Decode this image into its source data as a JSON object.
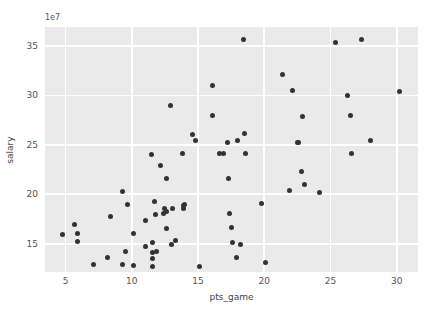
{
  "chart_data": {
    "type": "scatter",
    "title": "",
    "xlabel": "pts_game",
    "ylabel": "salary",
    "y_offset_text": "1e7",
    "y_offset_multiplier": 10000000,
    "xlim": [
      3.45,
      31.6
    ],
    "ylim": [
      12150000,
      36900000
    ],
    "xticks": [
      5,
      10,
      15,
      20,
      25,
      30
    ],
    "xtick_labels": [
      "5",
      "10",
      "15",
      "20",
      "25",
      "30"
    ],
    "yticks": [
      15000000,
      20000000,
      25000000,
      30000000,
      35000000
    ],
    "ytick_labels": [
      "15",
      "20",
      "25",
      "30",
      "35"
    ],
    "grid": true,
    "grid_color": "#ffffff",
    "axes_facecolor": "#eaeaea",
    "figure_facecolor": "#ffffff",
    "marker_color": "#333333",
    "marker_size": 5,
    "legend": null,
    "points": [
      [
        4.8,
        15900000
      ],
      [
        5.7,
        16900000
      ],
      [
        5.9,
        16000000
      ],
      [
        5.9,
        15200000
      ],
      [
        7.1,
        12900000
      ],
      [
        8.2,
        13600000
      ],
      [
        8.4,
        17800000
      ],
      [
        9.3,
        20300000
      ],
      [
        9.3,
        12900000
      ],
      [
        9.5,
        14200000
      ],
      [
        9.7,
        19000000
      ],
      [
        10.1,
        16000000
      ],
      [
        10.1,
        12800000
      ],
      [
        11.0,
        17400000
      ],
      [
        11.0,
        14700000
      ],
      [
        11.5,
        24000000
      ],
      [
        11.6,
        15100000
      ],
      [
        11.6,
        14100000
      ],
      [
        11.6,
        13500000
      ],
      [
        11.6,
        12700000
      ],
      [
        11.7,
        19300000
      ],
      [
        11.8,
        18000000
      ],
      [
        11.9,
        14200000
      ],
      [
        12.2,
        22900000
      ],
      [
        12.4,
        18100000
      ],
      [
        12.5,
        18600000
      ],
      [
        12.6,
        21600000
      ],
      [
        12.6,
        18300000
      ],
      [
        12.6,
        16500000
      ],
      [
        12.9,
        29000000
      ],
      [
        13.0,
        14900000
      ],
      [
        13.1,
        18600000
      ],
      [
        13.3,
        15300000
      ],
      [
        13.8,
        24100000
      ],
      [
        13.9,
        18900000
      ],
      [
        13.9,
        18600000
      ],
      [
        14.0,
        19000000
      ],
      [
        14.6,
        26000000
      ],
      [
        14.8,
        25400000
      ],
      [
        15.1,
        12700000
      ],
      [
        16.1,
        31000000
      ],
      [
        16.1,
        28000000
      ],
      [
        16.6,
        24100000
      ],
      [
        16.9,
        24100000
      ],
      [
        17.2,
        25200000
      ],
      [
        17.3,
        21600000
      ],
      [
        17.4,
        18100000
      ],
      [
        17.5,
        16600000
      ],
      [
        17.6,
        15100000
      ],
      [
        17.9,
        13600000
      ],
      [
        18.0,
        25400000
      ],
      [
        18.2,
        14900000
      ],
      [
        18.4,
        35600000
      ],
      [
        18.5,
        26100000
      ],
      [
        18.6,
        24100000
      ],
      [
        19.8,
        19100000
      ],
      [
        20.1,
        13100000
      ],
      [
        21.4,
        32100000
      ],
      [
        21.9,
        20400000
      ],
      [
        22.1,
        30500000
      ],
      [
        22.5,
        25200000
      ],
      [
        22.6,
        25200000
      ],
      [
        22.8,
        22300000
      ],
      [
        22.9,
        27900000
      ],
      [
        23.0,
        21000000
      ],
      [
        24.2,
        20200000
      ],
      [
        25.4,
        35300000
      ],
      [
        26.3,
        30000000
      ],
      [
        26.5,
        28000000
      ],
      [
        26.6,
        24100000
      ],
      [
        27.3,
        35600000
      ],
      [
        28.0,
        25400000
      ],
      [
        30.2,
        30400000
      ]
    ]
  }
}
